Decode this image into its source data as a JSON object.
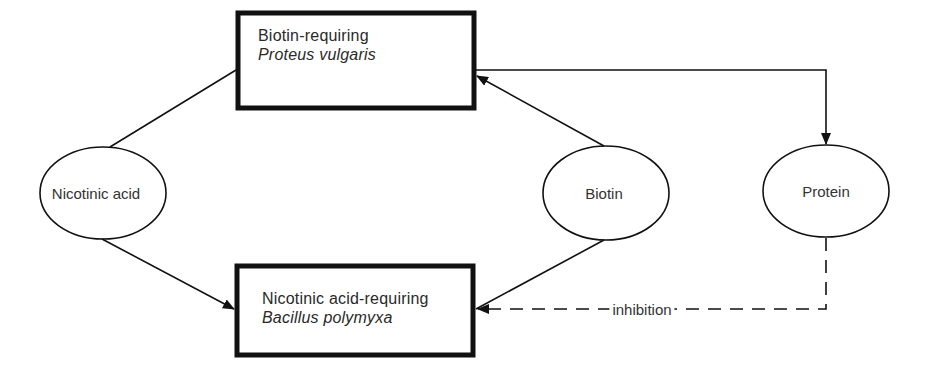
{
  "diagram": {
    "nodes": {
      "proteus": {
        "shape": "rectangle",
        "line1": "Biotin-requiring",
        "line2": "Proteus vulgaris"
      },
      "bacillus": {
        "shape": "rectangle",
        "line1": "Nicotinic acid-requiring",
        "line2": "Bacillus polymyxa"
      },
      "nicotinic_acid": {
        "shape": "ellipse",
        "label": "Nicotinic acid"
      },
      "biotin": {
        "shape": "ellipse",
        "label": "Biotin"
      },
      "protein": {
        "shape": "ellipse",
        "label": "Protein"
      }
    },
    "edges": [
      {
        "from": "nicotinic_acid",
        "to": "proteus",
        "style": "solid",
        "arrow": false
      },
      {
        "from": "nicotinic_acid",
        "to": "bacillus",
        "style": "solid",
        "arrow": true
      },
      {
        "from": "biotin",
        "to": "proteus",
        "style": "solid",
        "arrow": true
      },
      {
        "from": "biotin",
        "to": "bacillus",
        "style": "solid",
        "arrow": false
      },
      {
        "from": "proteus",
        "to": "protein",
        "style": "solid",
        "arrow": true
      },
      {
        "from": "protein",
        "to": "bacillus",
        "style": "dashed",
        "arrow": true,
        "label": "inhibition"
      }
    ],
    "colors": {
      "line": "#111111",
      "background": "#ffffff"
    }
  }
}
